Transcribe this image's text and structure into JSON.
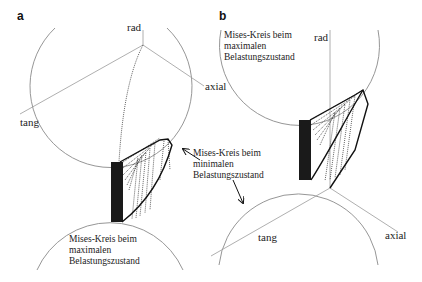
{
  "panels": [
    {
      "id": "a",
      "letter": "a",
      "axes": {
        "rad": "rad",
        "tang": "tang",
        "axial": "axial"
      },
      "annotations": [
        {
          "lines": [
            "Mises-Kreis beim",
            "minimalen",
            "Belastungszustand"
          ]
        },
        {
          "lines": [
            "Mises-Kreis beim",
            "maximalen",
            "Belastungszustand"
          ]
        }
      ]
    },
    {
      "id": "b",
      "letter": "b",
      "axes": {
        "rad": "rad",
        "tang": "tang",
        "axial": "axial"
      },
      "annotations": [
        {
          "lines": [
            "Mises-Kreis beim",
            "maximalen",
            "Belastungszustand"
          ]
        }
      ]
    }
  ],
  "colors": {
    "circle": "#8a8a8a",
    "axis": "#9a9a9a",
    "path": "#111111",
    "background": "#ffffff"
  }
}
